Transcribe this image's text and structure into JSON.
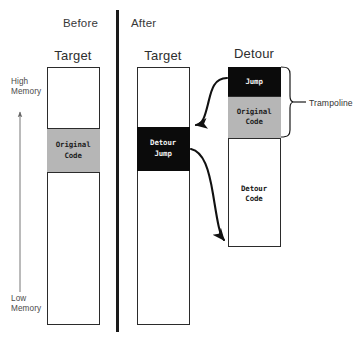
{
  "figure": {
    "title_before": "Before",
    "title_after": "After"
  },
  "axis": {
    "high_label": "High\nMemory",
    "low_label": "Low\nMemory",
    "direction_icon": "up-arrow-icon"
  },
  "columns": {
    "before_target": {
      "title": "Target",
      "blocks": [
        {
          "name": "free-upper",
          "label": "",
          "fill": "#ffffff"
        },
        {
          "name": "original-code",
          "label": "Original\nCode",
          "fill": "#b6b6b6"
        },
        {
          "name": "free-lower",
          "label": "",
          "fill": "#ffffff"
        }
      ]
    },
    "after_target": {
      "title": "Target",
      "blocks": [
        {
          "name": "free-upper",
          "label": "",
          "fill": "#ffffff"
        },
        {
          "name": "detour-jump",
          "label": "Detour\nJump",
          "fill": "#0b0b0b"
        },
        {
          "name": "free-lower",
          "label": "",
          "fill": "#ffffff"
        }
      ]
    },
    "detour": {
      "title": "Detour",
      "blocks": [
        {
          "name": "jump",
          "label": "Jump",
          "fill": "#0b0b0b"
        },
        {
          "name": "original-code",
          "label": "Original\nCode",
          "fill": "#b6b6b6"
        },
        {
          "name": "detour-code",
          "label": "Detour\nCode",
          "fill": "#ffffff"
        }
      ]
    }
  },
  "annotations": {
    "trampoline": "Trampoline"
  },
  "colors": {
    "outline": "#2b2b2b",
    "gray_block": "#b6b6b6",
    "black_block": "#0b0b0b",
    "divider": "#1a1a1a",
    "text": "#3a3a3a"
  }
}
